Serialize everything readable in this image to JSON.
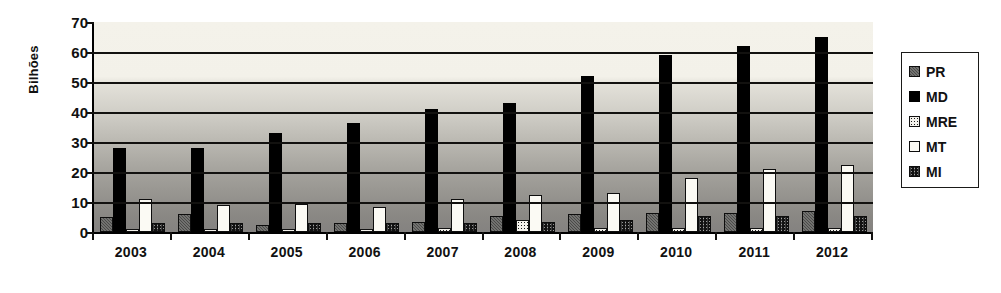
{
  "chart_data": {
    "type": "bar",
    "title": "",
    "subtitle": "",
    "xlabel": "",
    "ylabel": "Bilhões",
    "ylim": [
      0,
      70
    ],
    "ytick_step": 10,
    "yticks": [
      70,
      60,
      50,
      40,
      30,
      20,
      10,
      0
    ],
    "grid": true,
    "grid_axis": "y",
    "legend_position": "right",
    "categories": [
      "2003",
      "2004",
      "2005",
      "2006",
      "2007",
      "2008",
      "2009",
      "2010",
      "2011",
      "2012"
    ],
    "series": [
      {
        "name": "PR",
        "values": [
          5,
          6,
          2.5,
          3,
          3.5,
          5.5,
          6,
          6.5,
          6.5,
          7
        ]
      },
      {
        "name": "MD",
        "values": [
          28,
          28,
          33,
          36.5,
          41,
          43,
          52,
          59,
          62,
          65
        ]
      },
      {
        "name": "MRE",
        "values": [
          1,
          1,
          1,
          1,
          1.5,
          4,
          1.5,
          1.5,
          1.5,
          1.5
        ]
      },
      {
        "name": "MT",
        "values": [
          11,
          9,
          9.5,
          8.5,
          11,
          12.5,
          13,
          18,
          21,
          22.5
        ]
      },
      {
        "name": "MI",
        "values": [
          3,
          3,
          3,
          3,
          3,
          3.5,
          4,
          5.5,
          5.5,
          5.5
        ]
      }
    ],
    "legend_entries": [
      {
        "label": "PR",
        "pattern": "dark-gray-checker"
      },
      {
        "label": "MD",
        "pattern": "solid-black"
      },
      {
        "label": "MRE",
        "pattern": "white-dotted"
      },
      {
        "label": "MT",
        "pattern": "solid-white"
      },
      {
        "label": "MI",
        "pattern": "black-cross-hatch"
      }
    ]
  },
  "colors": {
    "axis": "#12110f",
    "plot_bg_top": "#f4f2ea",
    "plot_bg_bottom": "#848280",
    "text": "#111111",
    "legend_border": "#1a1a18"
  }
}
